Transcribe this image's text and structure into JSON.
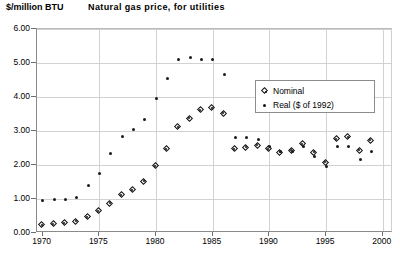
{
  "chart_data": {
    "type": "scatter",
    "title": "Natural  gas  price,  for  utilities",
    "ylabel": "$/million BTU",
    "xlabel": "",
    "xlim": [
      1969.5,
      2000.9
    ],
    "ylim": [
      0.0,
      6.0
    ],
    "yticks": [
      "0.00",
      "1.00",
      "2.00",
      "3.00",
      "4.00",
      "5.00",
      "6.00"
    ],
    "ytick_values": [
      0,
      1,
      2,
      3,
      4,
      5,
      6
    ],
    "xticks": [
      "1970",
      "1975",
      "1980",
      "1985",
      "1990",
      "1995",
      "2000"
    ],
    "xtick_values": [
      1970,
      1975,
      1980,
      1985,
      1990,
      1995,
      2000
    ],
    "grid": true,
    "legend_position": "upper right",
    "x": [
      1970,
      1971,
      1972,
      1973,
      1974,
      1975,
      1976,
      1977,
      1978,
      1979,
      1980,
      1981,
      1982,
      1983,
      1984,
      1985,
      1986,
      1987,
      1988,
      1989,
      1990,
      1991,
      1992,
      1993,
      1994,
      1995,
      1996,
      1997,
      1998,
      1999
    ],
    "series": [
      {
        "name": "Nominal",
        "marker": "diamond",
        "values": [
          0.22,
          0.25,
          0.27,
          0.32,
          0.45,
          0.62,
          0.85,
          1.1,
          1.25,
          1.5,
          1.95,
          2.45,
          3.1,
          3.35,
          3.6,
          3.65,
          3.5,
          2.45,
          2.5,
          2.55,
          2.45,
          2.35,
          2.4,
          2.6,
          2.35,
          2.05,
          2.75,
          2.8,
          2.4,
          2.7
        ]
      },
      {
        "name": "Real ($ of 1992)",
        "marker": "dot",
        "values": [
          0.97,
          0.98,
          1.0,
          1.05,
          1.4,
          1.75,
          2.35,
          2.85,
          3.05,
          3.35,
          3.95,
          4.55,
          5.1,
          5.15,
          5.1,
          5.1,
          4.65,
          2.8,
          2.8,
          2.75,
          2.55,
          2.4,
          2.4,
          2.55,
          2.25,
          1.95,
          2.55,
          2.55,
          2.15,
          2.4
        ]
      }
    ]
  }
}
